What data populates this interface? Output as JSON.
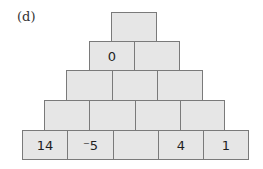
{
  "label": "(d)",
  "colors": {
    "cell_fill": "#e6e6e6",
    "cell_border": "#7a7a7a",
    "text": "#1e1e1e"
  },
  "pyramid": {
    "rows": [
      {
        "cells": [
          {
            "value": "",
            "x": 111,
            "y": 12,
            "w": 46,
            "h": 30
          }
        ]
      },
      {
        "cells": [
          {
            "value": "0",
            "x": 89,
            "y": 41,
            "w": 46,
            "h": 30
          },
          {
            "value": "",
            "x": 134,
            "y": 41,
            "w": 46,
            "h": 30
          }
        ]
      },
      {
        "cells": [
          {
            "value": "",
            "x": 66,
            "y": 70,
            "w": 47,
            "h": 31
          },
          {
            "value": "",
            "x": 112,
            "y": 70,
            "w": 46,
            "h": 31
          },
          {
            "value": "",
            "x": 157,
            "y": 70,
            "w": 46,
            "h": 31
          }
        ]
      },
      {
        "cells": [
          {
            "value": "",
            "x": 44,
            "y": 100,
            "w": 46,
            "h": 31
          },
          {
            "value": "",
            "x": 89,
            "y": 100,
            "w": 47,
            "h": 31
          },
          {
            "value": "",
            "x": 135,
            "y": 100,
            "w": 46,
            "h": 31
          },
          {
            "value": "",
            "x": 180,
            "y": 100,
            "w": 45,
            "h": 31
          }
        ]
      },
      {
        "cells": [
          {
            "value": "14",
            "x": 22,
            "y": 130,
            "w": 46,
            "h": 30
          },
          {
            "value": "⁻5",
            "x": 67,
            "y": 130,
            "w": 47,
            "h": 30
          },
          {
            "value": "",
            "x": 113,
            "y": 130,
            "w": 46,
            "h": 30
          },
          {
            "value": "4",
            "x": 158,
            "y": 130,
            "w": 46,
            "h": 30
          },
          {
            "value": "1",
            "x": 203,
            "y": 130,
            "w": 46,
            "h": 30
          }
        ]
      }
    ]
  }
}
